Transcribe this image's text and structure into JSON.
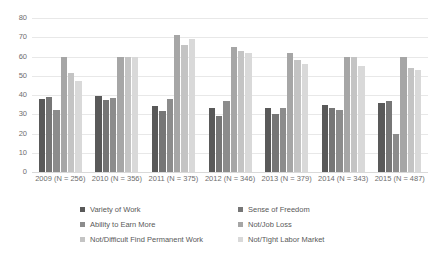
{
  "chart_data": {
    "type": "bar",
    "title": "",
    "subtitle": "",
    "xlabel": "",
    "ylabel": "",
    "ylim": [
      0,
      80
    ],
    "ytick_values": [
      80,
      70,
      60,
      50,
      40,
      30,
      20,
      10,
      0
    ],
    "ytick_labels": [
      "80",
      "70",
      "60",
      "50",
      "40",
      "30",
      "20",
      "10",
      "0"
    ],
    "grid": true,
    "legend_position": "bottom",
    "categories": [
      "2009 (N = 256)",
      "2010 (N = 356)",
      "2011 (N = 375)",
      "2012 (N = 346)",
      "2013 (N = 379)",
      "2014 (N = 343)",
      "2015 (N = 487)"
    ],
    "series": [
      {
        "name": "Variety of Work",
        "color": "#595959",
        "values": [
          38,
          39.5,
          34.5,
          33,
          33,
          35,
          36
        ]
      },
      {
        "name": "Sense of Freedom",
        "color": "#767676",
        "values": [
          39,
          37.5,
          31.5,
          29,
          30,
          33,
          37
        ]
      },
      {
        "name": "Ability to Earn More",
        "color": "#8c8c8c",
        "values": [
          32,
          38.5,
          38,
          37,
          33,
          32,
          20
        ]
      },
      {
        "name": "Not/Job Loss",
        "color": "#a6a6a6",
        "values": [
          60,
          59.5,
          71,
          65,
          62,
          60,
          60
        ]
      },
      {
        "name": "Not/Difficult Find Permanent Work",
        "color": "#c4c4c4",
        "values": [
          51.5,
          60,
          66,
          63,
          58,
          60,
          54
        ]
      },
      {
        "name": "Not/Tight Labor Market",
        "color": "#d9d9d9",
        "values": [
          47.5,
          60,
          69,
          62,
          56,
          55,
          53
        ]
      }
    ]
  }
}
